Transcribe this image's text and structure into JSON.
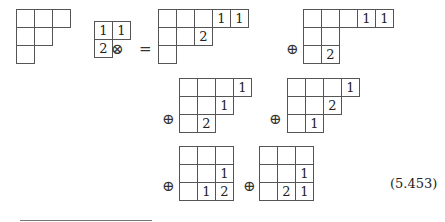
{
  "equation": {
    "number": "(5.453)",
    "operators": {
      "tensor": "⊗",
      "equals": "=",
      "direct_sum": "⊕"
    },
    "lhs": {
      "left_tableau": {
        "shape": [
          3,
          2,
          1
        ],
        "entries": [
          [
            "",
            "",
            ""
          ],
          [
            "",
            ""
          ],
          [
            ""
          ]
        ]
      },
      "right_tableau": {
        "shape": [
          2,
          1
        ],
        "entries": [
          [
            "1",
            "1"
          ],
          [
            "2"
          ]
        ]
      }
    },
    "rhs_terms": [
      {
        "shape": [
          5,
          3,
          1
        ],
        "entries": [
          [
            "",
            "",
            "",
            "1",
            "1"
          ],
          [
            "",
            "",
            "2"
          ],
          [
            ""
          ]
        ]
      },
      {
        "shape": [
          5,
          2,
          2
        ],
        "entries": [
          [
            "",
            "",
            "",
            "1",
            "1"
          ],
          [
            "",
            ""
          ],
          [
            "",
            "2"
          ]
        ]
      },
      {
        "shape": [
          4,
          3,
          2
        ],
        "entries": [
          [
            "",
            "",
            "",
            "1"
          ],
          [
            "",
            "",
            "1"
          ],
          [
            "",
            "2"
          ]
        ]
      },
      {
        "shape": [
          4,
          3,
          2
        ],
        "entries": [
          [
            "",
            "",
            "",
            "1"
          ],
          [
            "",
            "",
            "2"
          ],
          [
            "",
            "1"
          ]
        ]
      },
      {
        "shape": [
          3,
          3,
          3
        ],
        "entries": [
          [
            "",
            "",
            ""
          ],
          [
            "",
            "",
            "1"
          ],
          [
            "",
            "1",
            "2"
          ]
        ]
      },
      {
        "shape": [
          3,
          3,
          3
        ],
        "entries": [
          [
            "",
            "",
            ""
          ],
          [
            "",
            "",
            "1"
          ],
          [
            "",
            "2",
            "1"
          ]
        ]
      }
    ]
  }
}
